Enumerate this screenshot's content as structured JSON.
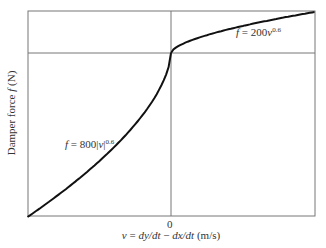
{
  "figure": {
    "y_axis_label": "Damper force f (N)",
    "y_axis_label_parts": {
      "prefix": "Damper force ",
      "var": "f",
      "suffix": " (N)"
    },
    "x_axis_label_parts": {
      "var_v": "v",
      "eq": " = ",
      "dy": "dy/dt",
      "minus": " − ",
      "dx": "dx/dt",
      "units": " (m/s)"
    },
    "x_tick_zero": "0",
    "eq_positive": {
      "f": "f",
      "eq": " = 200",
      "v": "v",
      "exp": "0.6"
    },
    "eq_negative": {
      "f": "f",
      "eq": " = 800|",
      "v": "v",
      "bar": "|",
      "exp": "0.6"
    },
    "colors": {
      "curve": "#111111",
      "frame": "#777777",
      "text": "#333333"
    }
  },
  "chart_data": {
    "type": "line",
    "title": "",
    "xlabel": "v = dy/dt − dx/dt (m/s)",
    "ylabel": "Damper force f (N)",
    "x_ticks": [
      "0"
    ],
    "grid": false,
    "series": [
      {
        "name": "f = 800|v|^0.6 (v < 0, compression)",
        "formula": "f = -800|v|^0.6",
        "x": [
          -1.0,
          -0.75,
          -0.5,
          -0.25,
          -0.1,
          0
        ],
        "y": [
          -800,
          -673,
          -528,
          -348,
          -201,
          0
        ]
      },
      {
        "name": "f = 200v^0.6 (v > 0, extension)",
        "formula": "f = 200 v^0.6",
        "x": [
          0,
          0.1,
          0.25,
          0.5,
          0.75,
          1.0
        ],
        "y": [
          0,
          50,
          87,
          132,
          168,
          200
        ]
      }
    ],
    "annotations": [
      "f = 200v^0.6",
      "f = 800|v|^0.6"
    ],
    "xlim": [
      -1,
      1
    ],
    "ylim": [
      -800,
      200
    ]
  }
}
